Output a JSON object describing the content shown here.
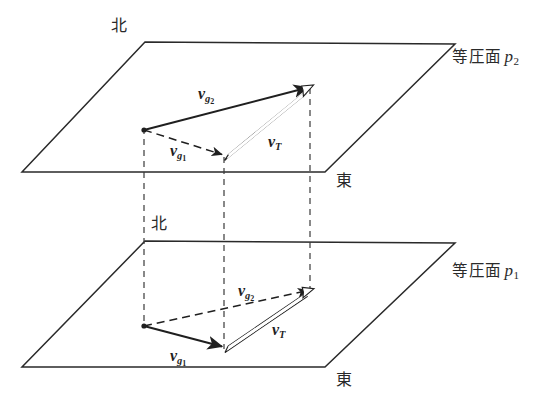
{
  "figure": {
    "background_color": "#ffffff",
    "line_color": "#2a2a2a",
    "width": 534,
    "height": 407
  },
  "planes": [
    {
      "id": "upper",
      "label": "等圧面",
      "symbol": "p",
      "subscript": "2",
      "north_label": "北",
      "east_label": "東",
      "outline": "145,42 455,44 325,172 22,172"
    },
    {
      "id": "lower",
      "label": "等圧面",
      "symbol": "p",
      "subscript": "1",
      "north_label": "北",
      "east_label": "東",
      "outline": "145,241 455,243 325,367 22,367"
    }
  ],
  "vectors": {
    "upper": [
      {
        "name": "v_g2",
        "base": "v",
        "sub": "g",
        "sub2": "2",
        "style": "solid",
        "from": [
          144,
          130
        ],
        "to": [
          310,
          87
        ],
        "label_x": 198,
        "label_y": 86
      },
      {
        "name": "v_g1",
        "base": "v",
        "sub": "g",
        "sub2": "1",
        "style": "dashed",
        "from": [
          144,
          130
        ],
        "to": [
          224,
          155
        ],
        "label_x": 170,
        "label_y": 143
      },
      {
        "name": "v_T",
        "base": "v",
        "sub": "T",
        "sub2": "",
        "style": "hollow",
        "from": [
          226,
          157
        ],
        "to": [
          310,
          89
        ],
        "label_x": 268,
        "label_y": 134
      }
    ],
    "lower": [
      {
        "name": "v_g2",
        "base": "v",
        "sub": "g",
        "sub2": "2",
        "style": "dashed",
        "from": [
          144,
          326
        ],
        "to": [
          310,
          290
        ],
        "label_x": 238,
        "label_y": 283
      },
      {
        "name": "v_g1",
        "base": "v",
        "sub": "g",
        "sub2": "1",
        "style": "solid",
        "from": [
          144,
          326
        ],
        "to": [
          224,
          347
        ],
        "label_x": 170,
        "label_y": 348
      },
      {
        "name": "v_T",
        "base": "v",
        "sub": "T",
        "sub2": "",
        "style": "hollow",
        "from": [
          226,
          349
        ],
        "to": [
          310,
          292
        ],
        "label_x": 272,
        "label_y": 322
      }
    ]
  },
  "connectors": [
    {
      "name": "connector-origin",
      "x": 144,
      "y1": 128,
      "y2": 328
    },
    {
      "name": "connector-mid",
      "x": 224,
      "y1": 157,
      "y2": 349
    },
    {
      "name": "connector-right",
      "x": 310,
      "y1": 88,
      "y2": 292
    }
  ],
  "labels": {
    "upper_north": {
      "text": "北",
      "x": 111,
      "y": 18
    },
    "upper_east": {
      "text": "東",
      "x": 336,
      "y": 173
    },
    "upper_plane": {
      "text": "等圧面",
      "x": 452,
      "y": 48
    },
    "lower_north": {
      "text": "北",
      "x": 151,
      "y": 216
    },
    "lower_east": {
      "text": "東",
      "x": 336,
      "y": 372
    },
    "lower_plane": {
      "text": "等圧面",
      "x": 452,
      "y": 262
    }
  }
}
